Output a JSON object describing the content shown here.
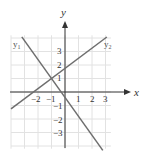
{
  "chart_data": {
    "type": "line",
    "title": "",
    "xlabel": "x",
    "ylabel": "y",
    "xlim": [
      -4,
      3.5
    ],
    "ylim": [
      -4,
      4.2
    ],
    "grid": true,
    "x_ticks": [
      "-2",
      "-1",
      "1",
      "2",
      "3"
    ],
    "y_ticks": [
      "3",
      "2",
      "1",
      "-1",
      "-2",
      "-3"
    ],
    "series": [
      {
        "name": "y1",
        "label": "y",
        "sub": "1",
        "slope": -1.4,
        "intercept": -0.4,
        "x_range": [
          -3.2,
          2.8
        ]
      },
      {
        "name": "y2",
        "label": "y",
        "sub": "2",
        "slope": 0.75,
        "intercept": 1.75,
        "x_range": [
          -4,
          3.1
        ]
      }
    ],
    "intersection": {
      "x": -1,
      "y": 1
    }
  },
  "labels": {
    "x_axis": "x",
    "y_axis": "y",
    "y1_main": "y",
    "y1_sub": "1",
    "y2_main": "y",
    "y2_sub": "2",
    "tick_x_neg2": "−2",
    "tick_x_neg1": "−1",
    "tick_x_1": "1",
    "tick_x_2": "2",
    "tick_x_3": "3",
    "tick_y_3": "3",
    "tick_y_2": "2",
    "tick_y_1": "1",
    "tick_y_neg1": "−1",
    "tick_y_neg2": "−2",
    "tick_y_neg3": "−3"
  },
  "colors": {
    "grid": "#e2e2e2",
    "axis": "#333333",
    "line": "#6e6e6e"
  }
}
